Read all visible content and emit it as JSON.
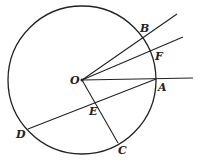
{
  "diagram": {
    "circle": {
      "cx": 82,
      "cy": 80,
      "r": 74
    },
    "center_label": "O",
    "points": [
      {
        "id": "A",
        "label": "A",
        "x": 156,
        "y": 79,
        "lx": 158,
        "ly": 91
      },
      {
        "id": "B",
        "label": "B",
        "x": 143,
        "y": 38,
        "lx": 140,
        "ly": 32
      },
      {
        "id": "F",
        "label": "F",
        "x": 153,
        "y": 52,
        "lx": 155,
        "ly": 60
      },
      {
        "id": "C",
        "label": "C",
        "x": 118,
        "y": 143,
        "lx": 118,
        "ly": 154
      },
      {
        "id": "D",
        "label": "D",
        "x": 28,
        "y": 129,
        "lx": 16,
        "ly": 138
      },
      {
        "id": "E",
        "label": "E",
        "x": 95,
        "y": 101,
        "lx": 89,
        "ly": 115
      }
    ],
    "segments": [
      {
        "name": "ray-OB",
        "x1": 82,
        "y1": 80,
        "x2": 177,
        "y2": 14
      },
      {
        "name": "ray-OF",
        "x1": 82,
        "y1": 80,
        "x2": 183,
        "y2": 37
      },
      {
        "name": "ray-OA",
        "x1": 82,
        "y1": 80,
        "x2": 193,
        "y2": 78
      },
      {
        "name": "chord-DA",
        "x1": 28,
        "y1": 129,
        "x2": 156,
        "y2": 79
      },
      {
        "name": "segment-OC",
        "x1": 82,
        "y1": 80,
        "x2": 118,
        "y2": 143
      }
    ]
  }
}
